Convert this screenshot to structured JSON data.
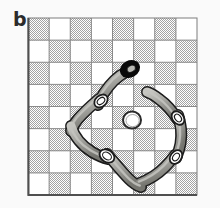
{
  "figure": {
    "panel_label": "b",
    "width": 220,
    "height": 208,
    "background_color": "#fafafa",
    "caption_alt": "Panel b: a closed chain of curved links lying on an 8 by 8 checkerboard, with a black ring at the top link and a small white ring near the board centre."
  },
  "board": {
    "name": "checkerboard",
    "columns": 8,
    "rows": 8,
    "x": 28,
    "y": 18,
    "width": 169,
    "height": 177,
    "cell_width": 21.125,
    "cell_height": 22.125,
    "light_cell_color": "#ffffff",
    "dark_cell_color": "#c9c9c9",
    "dither_dot_color": "#a8a8a8",
    "gridline_color": "#8a8a8a",
    "border_color": "#555555",
    "first_cell_shaded": true,
    "shading_style": "halftone-dither"
  },
  "chain": {
    "name": "closed-chain",
    "link_count": 6,
    "link_fill_color": "#9a9a96",
    "link_highlight_color": "#c4c4bf",
    "link_shadow_color": "#6e6e6a",
    "link_outline_color": "#1c1c1c",
    "connector_fill_color": "#ffffff",
    "connector_outline_color": "#1c1c1c",
    "end_ring_color": "#0a0a0a",
    "links": [
      {
        "id": "link-top-left",
        "label": "upper-left link",
        "path": "M 126 72 C 118 76, 110 84, 104 93 C 101 98, 99 102, 98 105",
        "stroke_width": 9
      },
      {
        "id": "link-left",
        "label": "left link",
        "path": "M 99 99 C 92 105, 84 112, 78 119 C 74 124, 72 128, 71 131",
        "stroke_width": 9
      },
      {
        "id": "link-lower-left",
        "label": "lower-left link",
        "path": "M 71 126 C 74 136, 82 146, 92 152 C 99 156, 104 158, 108 159",
        "stroke_width": 9
      },
      {
        "id": "link-bottom",
        "label": "bottom link",
        "path": "M 107 154 C 114 162, 122 172, 129 179 C 134 184, 138 186, 141 187",
        "stroke_width": 9
      },
      {
        "id": "link-bottom-right",
        "label": "bottom-right link",
        "path": "M 140 183 C 148 180, 158 174, 165 167 C 170 162, 173 158, 175 155",
        "stroke_width": 9
      },
      {
        "id": "link-right",
        "label": "right link",
        "path": "M 176 158 C 180 149, 182 138, 181 129 C 180 122, 179 118, 178 115",
        "stroke_width": 9
      },
      {
        "id": "link-upper-right",
        "label": "upper-right link",
        "path": "M 178 120 C 173 112, 166 104, 159 99 C 154 95, 150 93, 147 92",
        "stroke_width": 9
      }
    ],
    "connectors": [
      {
        "id": "connector-upper-left",
        "label": "upper-left joint",
        "cx": 101,
        "cy": 101,
        "rx": 7.5,
        "ry": 5.5,
        "rotate": -42
      },
      {
        "id": "connector-lower-left",
        "label": "lower-left joint",
        "cx": 107,
        "cy": 156,
        "rx": 8,
        "ry": 6,
        "rotate": 34
      },
      {
        "id": "connector-bottom-right",
        "label": "bottom-right joint",
        "cx": 176,
        "cy": 157,
        "rx": 7.5,
        "ry": 5.5,
        "rotate": -54
      },
      {
        "id": "connector-upper-right",
        "label": "upper-right joint",
        "cx": 178,
        "cy": 118,
        "rx": 7.5,
        "ry": 5.5,
        "rotate": 50
      }
    ],
    "end_ring": {
      "id": "black-end-ring",
      "label": "black terminal ring",
      "cx": 130,
      "cy": 69,
      "rx": 10.5,
      "ry": 8.5,
      "rotate": -28,
      "hole_rx": 4.5,
      "hole_ry": 3.2
    }
  },
  "center_ring": {
    "name": "centre-white-ring",
    "label": "small white ring at board centre",
    "cx": 132,
    "cy": 120,
    "rx": 9,
    "ry": 8.5,
    "fill_color": "#ffffff",
    "outline_color": "#2a2a2a",
    "outline_width": 2
  }
}
